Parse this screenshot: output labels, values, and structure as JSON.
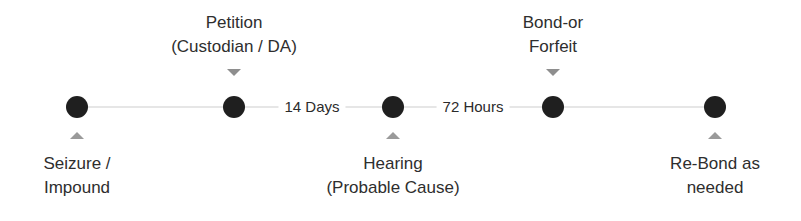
{
  "diagram": {
    "type": "timeline",
    "nodes": [
      {
        "x": 77,
        "position": "bottom",
        "lines": [
          "Seizure /",
          "Impound"
        ]
      },
      {
        "x": 234,
        "position": "top",
        "lines": [
          "Petition",
          "(Custodian / DA)"
        ]
      },
      {
        "x": 393,
        "position": "bottom",
        "lines": [
          "Hearing",
          "(Probable Cause)"
        ]
      },
      {
        "x": 553,
        "position": "top",
        "lines": [
          "Bond-or",
          "Forfeit"
        ]
      },
      {
        "x": 715,
        "position": "bottom",
        "lines": [
          "Re-Bond as",
          "needed"
        ]
      }
    ],
    "intervals": [
      {
        "between": [
          1,
          2
        ],
        "label": "14 Days",
        "x": 312
      },
      {
        "between": [
          2,
          3
        ],
        "label": "72 Hours",
        "x": 473
      }
    ],
    "colors": {
      "node": "#1f1f1f",
      "line": "#e6e6e6",
      "marker": "#9a9a9a",
      "text": "#2e2e2e"
    }
  }
}
